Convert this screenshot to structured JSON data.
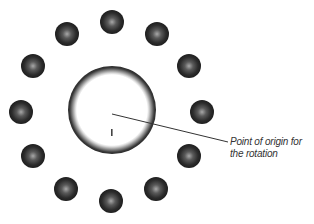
{
  "diagram": {
    "center": {
      "x": 112,
      "y": 110,
      "outer_radius": 44,
      "inner_radius": 36
    },
    "origin_marker": {
      "label": "I"
    },
    "dots": [
      {
        "x": 112,
        "y": 22
      },
      {
        "x": 157,
        "y": 34
      },
      {
        "x": 189,
        "y": 66
      },
      {
        "x": 202,
        "y": 112
      },
      {
        "x": 189,
        "y": 156
      },
      {
        "x": 156,
        "y": 189
      },
      {
        "x": 111,
        "y": 201
      },
      {
        "x": 66,
        "y": 189
      },
      {
        "x": 33,
        "y": 156
      },
      {
        "x": 21,
        "y": 112
      },
      {
        "x": 33,
        "y": 66
      },
      {
        "x": 67,
        "y": 34
      }
    ],
    "dot_radius": 12,
    "callout": {
      "line_1": "Point of origin for",
      "line_2": "the rotation"
    },
    "colors": {
      "dot": "#2a2a2a",
      "dot_highlight": "#9a9a9a",
      "ring": "#3c3c3c",
      "line": "#333333"
    }
  }
}
